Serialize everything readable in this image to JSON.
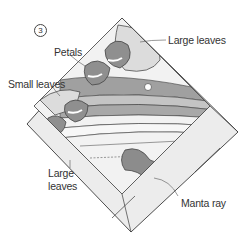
{
  "step_number": "3",
  "labels": {
    "large_leaves_top": "Large leaves",
    "petals": "Petals",
    "small_leaves": "Small leaves",
    "large_leaves_bottom_line1": "Large",
    "large_leaves_bottom_line2": "leaves",
    "manta_ray": "Manta ray"
  },
  "colors": {
    "outline": "#3a3a3a",
    "border_fill": "#ececec",
    "leaf_light": "#dcdcdc",
    "petal_dark": "#8f8f8f",
    "stripe_dark": "#a0a0a0",
    "stripe_mid": "#c4c4c4",
    "stripe_light": "#f2f2f2",
    "manta": "#8c8c8c"
  }
}
